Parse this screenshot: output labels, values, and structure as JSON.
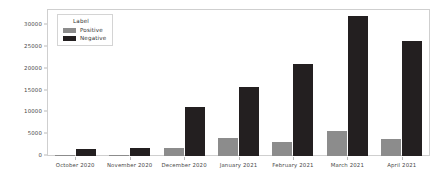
{
  "chart_data": {
    "type": "bar",
    "title": "",
    "xlabel": "",
    "ylabel": "",
    "grid": false,
    "legend_position": "upper-left",
    "categories": [
      "October 2020",
      "November 2020",
      "December 2020",
      "January 2021",
      "February 2021",
      "March 2021",
      "April 2021"
    ],
    "series": [
      {
        "name": "Positive",
        "color": "#8c8c8c",
        "values": [
          100,
          150,
          1800,
          4200,
          3300,
          5700,
          3800
        ]
      },
      {
        "name": "Negative",
        "color": "#231f20",
        "values": [
          1700,
          1900,
          11300,
          15800,
          21000,
          32200,
          26500
        ]
      }
    ],
    "ylim": [
      0,
      33500
    ],
    "yticks": [
      0,
      5000,
      10000,
      15000,
      20000,
      25000,
      30000
    ],
    "ytick_labels": [
      "0",
      "5000",
      "10000",
      "15000",
      "20000",
      "25000",
      "30000"
    ]
  },
  "legend": {
    "title": "Label",
    "entries": [
      {
        "label": "Positive",
        "color": "#8c8c8c"
      },
      {
        "label": "Negative",
        "color": "#231f20"
      }
    ]
  }
}
